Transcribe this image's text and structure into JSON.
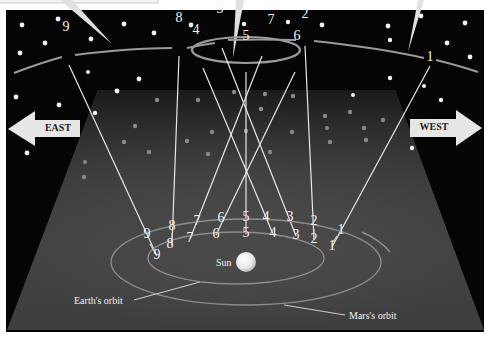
{
  "diagram": {
    "direction_labels": {
      "east": "EAST",
      "west": "WEST"
    },
    "labels": {
      "sun": "Sun",
      "earth_orbit": "Earth's orbit",
      "mars_orbit": "Mars's orbit"
    },
    "colors": {
      "sky": "#050505",
      "plane": "#4a4a4a",
      "line": "#e8e8e8",
      "arrow": "#e6e6e6",
      "frame": "#ffffff"
    },
    "sky_positions": [
      {
        "n": "1",
        "x": 430,
        "y": 58
      },
      {
        "n": "2",
        "x": 305,
        "y": 15
      },
      {
        "n": "3",
        "x": 220,
        "y": 10
      },
      {
        "n": "4",
        "x": 196,
        "y": 31
      },
      {
        "n": "5",
        "x": 246,
        "y": 37
      },
      {
        "n": "6",
        "x": 297,
        "y": 37
      },
      {
        "n": "7",
        "x": 271,
        "y": 21
      },
      {
        "n": "8",
        "x": 179,
        "y": 19
      },
      {
        "n": "9",
        "x": 66,
        "y": 28
      }
    ],
    "mars_positions": [
      {
        "n": "1",
        "x": 341,
        "y": 231
      },
      {
        "n": "2",
        "x": 314,
        "y": 222
      },
      {
        "n": "3",
        "x": 290,
        "y": 218
      },
      {
        "n": "4",
        "x": 266,
        "y": 218
      },
      {
        "n": "5",
        "x": 246,
        "y": 218
      },
      {
        "n": "6",
        "x": 221,
        "y": 219
      },
      {
        "n": "7",
        "x": 197,
        "y": 222
      },
      {
        "n": "8",
        "x": 172,
        "y": 227
      },
      {
        "n": "9",
        "x": 147,
        "y": 235
      }
    ],
    "earth_positions": [
      {
        "n": "1",
        "x": 332,
        "y": 247
      },
      {
        "n": "2",
        "x": 314,
        "y": 240
      },
      {
        "n": "3",
        "x": 296,
        "y": 236
      },
      {
        "n": "4",
        "x": 273,
        "y": 234
      },
      {
        "n": "5",
        "x": 246,
        "y": 234
      },
      {
        "n": "6",
        "x": 216,
        "y": 235
      },
      {
        "n": "7",
        "x": 190,
        "y": 239
      },
      {
        "n": "8",
        "x": 170,
        "y": 245
      },
      {
        "n": "9",
        "x": 157,
        "y": 256
      }
    ]
  }
}
